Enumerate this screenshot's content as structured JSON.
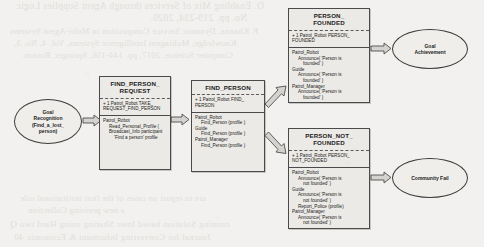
{
  "page": {
    "background_color": "#f2f1ef",
    "diagram_type": "uml-activity-state-diagram"
  },
  "bleed_through_text": {
    "note": "faint show-through text from reverse side of scanned page",
    "top_lines": [
      "O. Enabling Mix of Services through Agent Supplies Logic",
      "No. pp. 219-234, 2020.",
      "P. Khanna, Dynamic Service Composition in Multi-Agent Systems",
      "Knowledge, Multiagent Intelligence Systems, Vol. 4, No. 3,",
      "Computer Science, 2017, pp. 144-156, Springer, Boston."
    ],
    "bottom_lines": [
      "are to report on cases of the first institutional role",
      "a new pressing Collection",
      "running Solution based Inter Sharing using Hard two Q",
      "Journal for Converting Informant & Economic 40"
    ]
  },
  "nodes": {
    "goal_recognition": {
      "id": "goal-recognition",
      "shape": "ellipse",
      "lines": [
        "Goal",
        "Recognition",
        "(Find_a_lost_",
        "person)"
      ]
    },
    "goal_achievement": {
      "id": "goal-achievement",
      "shape": "ellipse",
      "lines": [
        "Goal",
        "Achievement"
      ]
    },
    "community_fail": {
      "id": "community-fail",
      "shape": "ellipse",
      "lines": [
        "Community Fail"
      ]
    },
    "find_person_request": {
      "id": "find-person-request",
      "shape": "uml-box",
      "title": [
        "FIND_PERSON_",
        "REQUEST"
      ],
      "trigger": [
        "+ 1 Patrol_Robot TAKE_",
        "REQUEST_FIND_PERSON"
      ],
      "body": [
        {
          "text": "Patrol_Robot",
          "indent": 0
        },
        {
          "text": "Read_Personal_Profile (",
          "indent": 1
        },
        {
          "text": "Broadcast_Info participant",
          "indent": 1
        },
        {
          "text": "'Find a person' profile",
          "indent": 2
        }
      ]
    },
    "find_person": {
      "id": "find-person",
      "shape": "uml-box",
      "title": [
        "FIND_PERSON"
      ],
      "trigger": [
        "+ 1 Patrol_Robot FIND_",
        "PERSON"
      ],
      "body": [
        {
          "text": "Patrol_Robot",
          "indent": 0
        },
        {
          "text": "Find_Person (profile )",
          "indent": 1
        },
        {
          "text": "Guide",
          "indent": 0
        },
        {
          "text": "Find_Person (profile )",
          "indent": 1
        },
        {
          "text": "Patrol_Manager",
          "indent": 0
        },
        {
          "text": "Find_Person (profile )",
          "indent": 1
        }
      ]
    },
    "person_founded": {
      "id": "person-founded",
      "shape": "uml-box",
      "title": [
        "PERSON_",
        "FOUNDED"
      ],
      "trigger": [
        "+ 1 Patrol_Robot PERSON_",
        "FOUNDED"
      ],
      "body": [
        {
          "text": "Patrol_Robot",
          "indent": 0
        },
        {
          "text": "Announce( 'Person is",
          "indent": 1
        },
        {
          "text": "founded' )",
          "indent": 2
        },
        {
          "text": "Guide",
          "indent": 0
        },
        {
          "text": "Announce( 'Person is",
          "indent": 1
        },
        {
          "text": "founded' )",
          "indent": 2
        },
        {
          "text": "Patrol_Manager",
          "indent": 0
        },
        {
          "text": "Announce( 'Person is",
          "indent": 1
        },
        {
          "text": "founded' )",
          "indent": 2
        }
      ]
    },
    "person_not_founded": {
      "id": "person-not-founded",
      "shape": "uml-box",
      "title": [
        "PERSON_NOT_",
        "FOUNDED"
      ],
      "trigger": [
        "+ 1 Patrol_Robot PERSON_",
        "NOT_FOUNDED"
      ],
      "body": [
        {
          "text": "Patrol_Robot",
          "indent": 0
        },
        {
          "text": "Announce( 'Person is",
          "indent": 1
        },
        {
          "text": "not founded' )",
          "indent": 2
        },
        {
          "text": "Guide",
          "indent": 0
        },
        {
          "text": "Announce( 'Person is",
          "indent": 1
        },
        {
          "text": "not founded' )",
          "indent": 2
        },
        {
          "text": "Report_Police (profile)",
          "indent": 1
        },
        {
          "text": "Patrol_Manager",
          "indent": 0
        },
        {
          "text": "Announce( 'Person is",
          "indent": 1
        },
        {
          "text": "not founded' )",
          "indent": 2
        }
      ]
    }
  },
  "edges": [
    {
      "id": "arrow-goal-to-request",
      "from": "goal_recognition",
      "to": "find_person_request",
      "style": "hollow-block",
      "direction": "right"
    },
    {
      "id": "arrow-request-to-find",
      "from": "find_person_request",
      "to": "find_person",
      "style": "hollow-block",
      "direction": "right"
    },
    {
      "id": "arrow-find-to-founded",
      "from": "find_person",
      "to": "person_founded",
      "style": "hollow-block",
      "direction": "up-right"
    },
    {
      "id": "arrow-find-to-not-founded",
      "from": "find_person",
      "to": "person_not_founded",
      "style": "hollow-block",
      "direction": "down-right"
    },
    {
      "id": "arrow-founded-to-goal-achievement",
      "from": "person_founded",
      "to": "goal_achievement",
      "style": "hollow-block",
      "direction": "right"
    },
    {
      "id": "arrow-not-founded-to-community-fail",
      "from": "person_not_founded",
      "to": "community_fail",
      "style": "hollow-block",
      "direction": "right"
    }
  ]
}
